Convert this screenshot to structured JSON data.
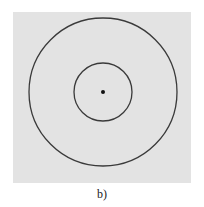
{
  "figure": {
    "caption": "b)",
    "background_color": "#e3e3e3",
    "stroke_color": "#3a3a3a",
    "center": {
      "x": 103,
      "y": 92
    },
    "outer_circle_radius": 74,
    "inner_circle_radius": 29,
    "center_dot_radius": 2
  }
}
